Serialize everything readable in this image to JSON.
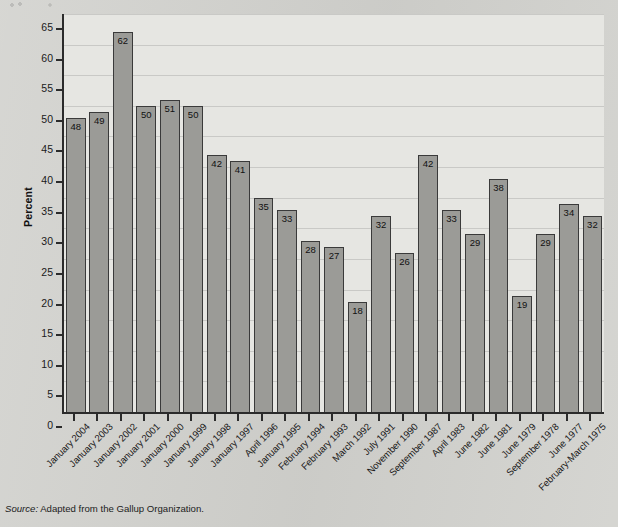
{
  "chart_data": {
    "type": "bar",
    "title": "",
    "xlabel": "",
    "ylabel": "Percent",
    "ylim": [
      0,
      65
    ],
    "ytick_step": 5,
    "yticks": [
      0,
      5,
      10,
      15,
      20,
      25,
      30,
      35,
      40,
      45,
      50,
      55,
      60,
      65
    ],
    "grid": true,
    "legend": "none",
    "categories": [
      "January 2004",
      "January 2003",
      "January 2002",
      "January 2001",
      "January 2000",
      "January 1999",
      "January 1998",
      "January 1997",
      "April 1996",
      "January 1995",
      "February 1994",
      "February 1993",
      "March 1992",
      "July 1991",
      "November 1990",
      "September 1987",
      "April 1983",
      "June 1982",
      "June 1981",
      "June 1979",
      "September 1978",
      "June 1977",
      "February-March 1975"
    ],
    "values": [
      48,
      49,
      62,
      50,
      51,
      50,
      42,
      41,
      35,
      33,
      28,
      27,
      18,
      32,
      26,
      42,
      33,
      29,
      38,
      19,
      29,
      34,
      32
    ],
    "bar_color": "#9b9b97",
    "bar_border_color": "#3a3a3a",
    "plot_background": "#e6e6e2",
    "axis_color": "#2b2b2b"
  },
  "source": {
    "label": "Source:",
    "text": " Adapted from the Gallup Organization."
  }
}
